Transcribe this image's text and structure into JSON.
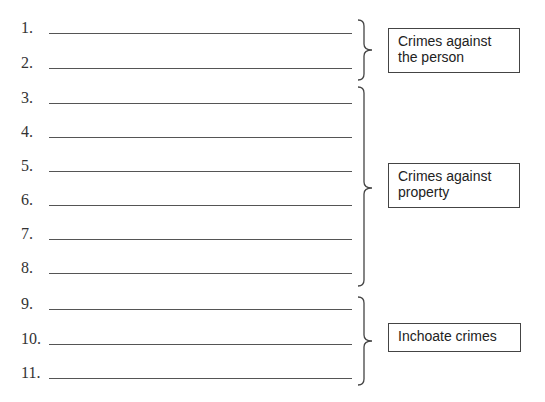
{
  "items": [
    {
      "label": "1."
    },
    {
      "label": "2."
    },
    {
      "label": "3."
    },
    {
      "label": "4."
    },
    {
      "label": "5."
    },
    {
      "label": "6."
    },
    {
      "label": "7."
    },
    {
      "label": "8."
    },
    {
      "label": "9."
    },
    {
      "label": "10."
    },
    {
      "label": "11."
    }
  ],
  "groups": [
    {
      "label": "Crimes against the person",
      "line1": "Crimes against",
      "line2": "the person"
    },
    {
      "label": "Crimes against property",
      "line1": "Crimes against",
      "line2": "property"
    },
    {
      "label": "Inchoate crimes",
      "line1": "Inchoate crimes",
      "line2": ""
    }
  ]
}
